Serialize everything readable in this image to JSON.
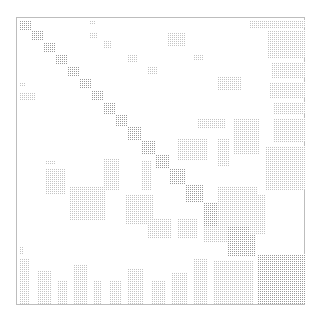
{
  "chart_data": {
    "type": "heatmap",
    "subtype": "sparsity-pattern (spy plot)",
    "title": "",
    "xlabel": "",
    "ylabel": "",
    "grid": false,
    "legend": null,
    "frame": {
      "x": 16,
      "y": 17,
      "width": 289,
      "height": 288,
      "border_color": "#bdbdbd"
    },
    "dot_color": "#9a9a9a",
    "blocks": [
      {
        "x": 2,
        "y": 2,
        "w": 12,
        "h": 10
      },
      {
        "x": 14,
        "y": 12,
        "w": 12,
        "h": 10
      },
      {
        "x": 26,
        "y": 24,
        "w": 12,
        "h": 10
      },
      {
        "x": 38,
        "y": 36,
        "w": 12,
        "h": 10
      },
      {
        "x": 50,
        "y": 48,
        "w": 12,
        "h": 10
      },
      {
        "x": 62,
        "y": 60,
        "w": 12,
        "h": 10
      },
      {
        "x": 74,
        "y": 72,
        "w": 12,
        "h": 10
      },
      {
        "x": 86,
        "y": 84,
        "w": 12,
        "h": 12
      },
      {
        "x": 98,
        "y": 96,
        "w": 12,
        "h": 12
      },
      {
        "x": 110,
        "y": 108,
        "w": 14,
        "h": 14
      },
      {
        "x": 124,
        "y": 122,
        "w": 14,
        "h": 14
      },
      {
        "x": 138,
        "y": 136,
        "w": 14,
        "h": 14
      },
      {
        "x": 152,
        "y": 150,
        "w": 16,
        "h": 16
      },
      {
        "x": 168,
        "y": 166,
        "w": 18,
        "h": 18
      },
      {
        "x": 186,
        "y": 184,
        "w": 24,
        "h": 24
      },
      {
        "x": 210,
        "y": 208,
        "w": 28,
        "h": 30
      },
      {
        "x": 240,
        "y": 236,
        "w": 48,
        "h": 50
      },
      {
        "x": 72,
        "y": 2,
        "w": 6,
        "h": 4,
        "light": true
      },
      {
        "x": 72,
        "y": 14,
        "w": 8,
        "h": 6,
        "light": true
      },
      {
        "x": 86,
        "y": 22,
        "w": 8,
        "h": 8,
        "light": true
      },
      {
        "x": 110,
        "y": 36,
        "w": 10,
        "h": 8,
        "light": true
      },
      {
        "x": 130,
        "y": 48,
        "w": 10,
        "h": 8,
        "light": true
      },
      {
        "x": 150,
        "y": 14,
        "w": 18,
        "h": 14,
        "light": true
      },
      {
        "x": 176,
        "y": 36,
        "w": 10,
        "h": 6,
        "light": true
      },
      {
        "x": 200,
        "y": 58,
        "w": 24,
        "h": 14,
        "light": true
      },
      {
        "x": 232,
        "y": 2,
        "w": 56,
        "h": 8,
        "light": true
      },
      {
        "x": 250,
        "y": 12,
        "w": 38,
        "h": 28,
        "light": true
      },
      {
        "x": 254,
        "y": 44,
        "w": 34,
        "h": 16,
        "light": true
      },
      {
        "x": 252,
        "y": 64,
        "w": 36,
        "h": 16,
        "light": true
      },
      {
        "x": 256,
        "y": 84,
        "w": 32,
        "h": 12,
        "light": true
      },
      {
        "x": 256,
        "y": 100,
        "w": 32,
        "h": 24,
        "light": true
      },
      {
        "x": 216,
        "y": 100,
        "w": 26,
        "h": 36,
        "light": true
      },
      {
        "x": 180,
        "y": 100,
        "w": 28,
        "h": 10,
        "light": true
      },
      {
        "x": 160,
        "y": 120,
        "w": 30,
        "h": 22,
        "light": true
      },
      {
        "x": 200,
        "y": 120,
        "w": 12,
        "h": 28,
        "light": true
      },
      {
        "x": 248,
        "y": 128,
        "w": 40,
        "h": 44,
        "light": true
      },
      {
        "x": 200,
        "y": 168,
        "w": 40,
        "h": 40,
        "light": true
      },
      {
        "x": 186,
        "y": 208,
        "w": 24,
        "h": 16,
        "light": true
      },
      {
        "x": 2,
        "y": 64,
        "w": 6,
        "h": 4,
        "light": true
      },
      {
        "x": 2,
        "y": 74,
        "w": 16,
        "h": 8,
        "light": true
      },
      {
        "x": 28,
        "y": 142,
        "w": 10,
        "h": 4,
        "light": true
      },
      {
        "x": 28,
        "y": 150,
        "w": 20,
        "h": 26,
        "light": true
      },
      {
        "x": 86,
        "y": 140,
        "w": 16,
        "h": 32,
        "light": true
      },
      {
        "x": 124,
        "y": 142,
        "w": 10,
        "h": 30,
        "light": true
      },
      {
        "x": 52,
        "y": 168,
        "w": 36,
        "h": 34,
        "light": true
      },
      {
        "x": 108,
        "y": 176,
        "w": 28,
        "h": 30,
        "light": true
      },
      {
        "x": 130,
        "y": 200,
        "w": 24,
        "h": 20,
        "light": true
      },
      {
        "x": 160,
        "y": 200,
        "w": 20,
        "h": 20,
        "light": true
      },
      {
        "x": 232,
        "y": 176,
        "w": 16,
        "h": 40,
        "light": true
      },
      {
        "x": 2,
        "y": 228,
        "w": 4,
        "h": 8,
        "light": true
      },
      {
        "x": 2,
        "y": 240,
        "w": 10,
        "h": 46,
        "light": true
      },
      {
        "x": 20,
        "y": 252,
        "w": 14,
        "h": 34,
        "light": true
      },
      {
        "x": 40,
        "y": 262,
        "w": 10,
        "h": 24,
        "light": true
      },
      {
        "x": 56,
        "y": 246,
        "w": 14,
        "h": 40,
        "light": true
      },
      {
        "x": 76,
        "y": 262,
        "w": 8,
        "h": 24,
        "light": true
      },
      {
        "x": 92,
        "y": 262,
        "w": 12,
        "h": 24,
        "light": true
      },
      {
        "x": 110,
        "y": 250,
        "w": 16,
        "h": 36,
        "light": true
      },
      {
        "x": 134,
        "y": 262,
        "w": 14,
        "h": 24,
        "light": true
      },
      {
        "x": 154,
        "y": 254,
        "w": 16,
        "h": 32,
        "light": true
      },
      {
        "x": 176,
        "y": 240,
        "w": 14,
        "h": 46,
        "light": true
      },
      {
        "x": 196,
        "y": 242,
        "w": 40,
        "h": 44,
        "light": true
      }
    ]
  }
}
